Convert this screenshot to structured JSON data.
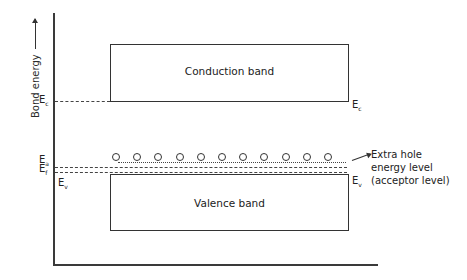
{
  "diagram": {
    "type": "energy-band-diagram",
    "y_axis_label": "Bond energy",
    "bands": {
      "conduction": {
        "label": "Conduction band"
      },
      "valence": {
        "label": "Valence band"
      }
    },
    "levels": {
      "Ec": {
        "symbol": "E",
        "subscript": "c"
      },
      "Ea": {
        "symbol": "E",
        "subscript": "a"
      },
      "Ef": {
        "symbol": "E",
        "subscript": "f"
      },
      "Ev": {
        "symbol": "E",
        "subscript": "v"
      }
    },
    "holes": {
      "count": 11
    },
    "annotation": {
      "line1": "Extra hole",
      "line2": "energy level",
      "line3": "(acceptor level)"
    }
  }
}
